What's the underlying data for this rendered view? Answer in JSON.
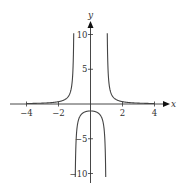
{
  "chart_data": {
    "type": "line",
    "title": "",
    "function": "y = 1/(x^2 - 1)",
    "xlabel": "x",
    "ylabel": "y",
    "xlim": [
      -4.3,
      4.7
    ],
    "ylim": [
      -11,
      12
    ],
    "x_ticks": [
      -4,
      -2,
      2,
      4
    ],
    "x_tick_labels": [
      "−4",
      "−2",
      "2",
      "4"
    ],
    "y_ticks": [
      10,
      5,
      -5,
      -10
    ],
    "y_tick_labels": [
      "10",
      "5",
      "5",
      "10"
    ],
    "y_tick_label_prefixes": [
      "",
      "",
      "−",
      "−"
    ],
    "vertical_asymptotes": [
      -1,
      1
    ],
    "horizontal_asymptote": 0,
    "grid": false,
    "legend": null,
    "series": [
      {
        "name": "left branch",
        "x_range": [
          -4,
          -1.05
        ],
        "sample": [
          [
            -4,
            0.067
          ],
          [
            -2,
            0.333
          ],
          [
            -1.5,
            0.8
          ],
          [
            -1.2,
            2.27
          ],
          [
            -1.05,
            9.76
          ]
        ]
      },
      {
        "name": "middle branch",
        "x_range": [
          -0.95,
          0.95
        ],
        "sample": [
          [
            -0.95,
            -10.26
          ],
          [
            -0.8,
            -2.78
          ],
          [
            -0.5,
            -1.33
          ],
          [
            0,
            -1
          ],
          [
            0.5,
            -1.33
          ],
          [
            0.8,
            -2.78
          ],
          [
            0.95,
            -10.26
          ]
        ]
      },
      {
        "name": "right branch",
        "x_range": [
          1.05,
          4
        ],
        "sample": [
          [
            1.05,
            9.76
          ],
          [
            1.2,
            2.27
          ],
          [
            1.5,
            0.8
          ],
          [
            2,
            0.333
          ],
          [
            4,
            0.067
          ]
        ]
      }
    ],
    "colors": {
      "curve": "#444444",
      "axis": "#333333"
    }
  }
}
